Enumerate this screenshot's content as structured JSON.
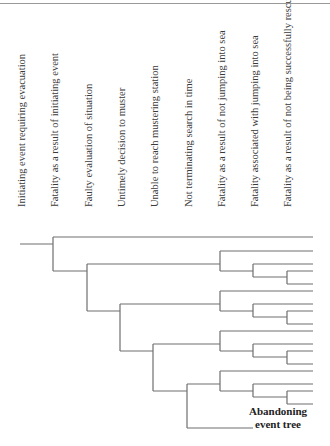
{
  "diagram": {
    "type": "event-tree",
    "column_headers": [
      {
        "id": "initiating",
        "label": "Initiating event requiring evacuation",
        "x": 22
      },
      {
        "id": "fatality-initiating",
        "label": "Fatality as a result of initiating event",
        "x": 55
      },
      {
        "id": "faulty-evaluation",
        "label": "Faulty evaluation of situation",
        "x": 89
      },
      {
        "id": "untimely-decision",
        "label": "Untimely decision to muster",
        "x": 122
      },
      {
        "id": "unable-reach",
        "label": "Unable to reach mustering station",
        "x": 155
      },
      {
        "id": "not-terminating",
        "label": "Not terminating search in time",
        "x": 189
      },
      {
        "id": "fatality-not-jumping",
        "label": "Fatality as a result of not jumping into sea",
        "x": 222
      },
      {
        "id": "fatality-jumping",
        "label": "Fatality associated with jumping into sea",
        "x": 255
      },
      {
        "id": "fatality-not-rescued",
        "label": "Fatality as a result of not being successfully rescued",
        "x": 288
      }
    ],
    "end_label_line1": "Abandoning",
    "end_label_line2": "event tree",
    "line_color": "#6e6e6e"
  }
}
